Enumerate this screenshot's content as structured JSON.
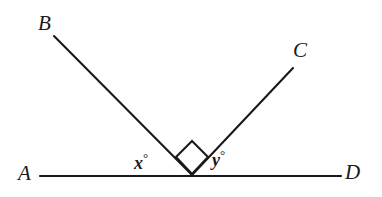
{
  "figure": {
    "background_color": "#ffffff",
    "stroke_color": "#1a1a1a",
    "text_color": "#1a1a1a"
  },
  "labels": {
    "A": "A",
    "B": "B",
    "C": "C",
    "D": "D",
    "x_angle": "x",
    "y_angle": "y",
    "degree_symbol": "°"
  },
  "chart_data": {
    "type": "diagram",
    "points": [
      {
        "name": "A",
        "x": 40,
        "y": 176,
        "label": "A"
      },
      {
        "name": "B",
        "x": 54,
        "y": 36,
        "label": "B"
      },
      {
        "name": "C",
        "x": 293,
        "y": 68,
        "label": "C"
      },
      {
        "name": "D",
        "x": 341,
        "y": 176,
        "label": "D"
      },
      {
        "name": "O",
        "x": 192,
        "y": 175,
        "label": ""
      }
    ],
    "segments": [
      {
        "name": "line-AD",
        "from": "A",
        "to": "D"
      },
      {
        "name": "ray-BO",
        "from": "B",
        "to": "O"
      },
      {
        "name": "ray-OC",
        "from": "O",
        "to": "C"
      }
    ],
    "angle_markers": [
      {
        "name": "angle-x",
        "label": "x°",
        "at": "O",
        "between": [
          "A",
          "B"
        ],
        "marker": "none"
      },
      {
        "name": "right-angle-BOC",
        "label": "",
        "at": "O",
        "between": [
          "B",
          "C"
        ],
        "marker": "square",
        "square_points": "192,174 176,157 192,141 208,157"
      },
      {
        "name": "angle-y",
        "label": "y°",
        "at": "O",
        "between": [
          "C",
          "D"
        ],
        "marker": "none"
      }
    ],
    "grid": false,
    "legend": false
  }
}
